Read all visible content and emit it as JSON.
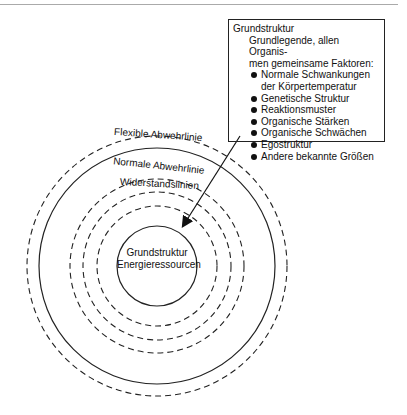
{
  "info_box": {
    "title": "Grundstruktur",
    "description_line1": "Grundlegende, allen Organis-",
    "description_line2": "men gemeinsame Faktoren:",
    "items": [
      "Normale Schwankungen der Körpertemperatur",
      "Genetische Struktur",
      "Reaktionsmuster",
      "Organische Stärken",
      "Organische Schwächen",
      "Egostruktur",
      "Andere bekannte Größen"
    ]
  },
  "rings": {
    "flexible": "Flexible Abwehrlinie",
    "normal": "Normale Abwehrlinie",
    "resistance": "Widerstandslinien"
  },
  "core": {
    "line1": "Grundstruktur",
    "line2": "Energieressourcen"
  }
}
